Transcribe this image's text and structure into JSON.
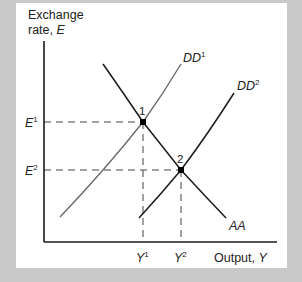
{
  "diagram": {
    "y_axis_label_line1": "Exchange",
    "y_axis_label_line2": "rate, ",
    "y_axis_var": "E",
    "x_axis_label": "Output, ",
    "x_axis_var": "Y",
    "curves": [
      {
        "name": "DD",
        "sup": "1",
        "color": "#6b6b6b"
      },
      {
        "name": "DD",
        "sup": "2",
        "color": "#1a1a1a"
      },
      {
        "name": "AA",
        "sup": "",
        "color": "#1a1a1a"
      }
    ],
    "equilibria": [
      {
        "label": "1",
        "e_label": "E",
        "e_sup": "1",
        "y_label": "Y",
        "y_sup": "1"
      },
      {
        "label": "2",
        "e_label": "E",
        "e_sup": "2",
        "y_label": "Y",
        "y_sup": "2"
      }
    ]
  },
  "colors": {
    "background": "#c9c9c9",
    "panel": "#ffffff",
    "axis": "#1a1a1a",
    "dd1": "#6b6b6b",
    "dd2": "#1a1a1a",
    "aa": "#1a1a1a",
    "guide": "#444444"
  }
}
